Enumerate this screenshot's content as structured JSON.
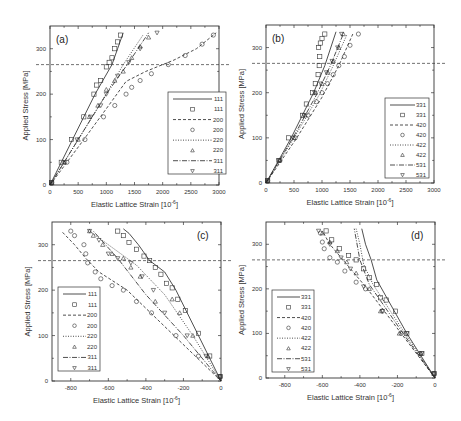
{
  "chart_data": [
    {
      "panel": "(a)",
      "type": "line",
      "xlabel": "Elastic Lattice Strain [10^-6]",
      "ylabel": "Applied Stress [MPa]",
      "xlim": [
        0,
        3000
      ],
      "ylim": [
        0,
        350
      ],
      "xticks": [
        "0",
        "500",
        "1000",
        "1500",
        "2000",
        "2500",
        "3000"
      ],
      "yticks": [
        "0",
        "100",
        "200",
        "300"
      ],
      "hline": 265,
      "legend_position": "lower right",
      "legend": [
        "111",
        "111",
        "200",
        "200",
        "220",
        "220",
        "311",
        "311"
      ],
      "series": [
        {
          "name": "111",
          "style": "solid",
          "kind": "model",
          "x": [
            0,
            400,
            800,
            1100,
            1200,
            1300
          ],
          "y": [
            0,
            100,
            200,
            265,
            300,
            335
          ]
        },
        {
          "name": "111",
          "style": "square",
          "kind": "exp",
          "x": [
            30,
            200,
            380,
            600,
            780,
            830,
            900,
            1000,
            1050,
            1100,
            1150,
            1200,
            1250
          ],
          "y": [
            5,
            50,
            100,
            150,
            200,
            220,
            230,
            260,
            270,
            280,
            300,
            315,
            330
          ]
        },
        {
          "name": "200",
          "style": "dashed",
          "kind": "model",
          "x": [
            0,
            600,
            1100,
            1350,
            1700,
            2200,
            2600,
            2950
          ],
          "y": [
            0,
            100,
            185,
            228,
            250,
            275,
            300,
            335
          ]
        },
        {
          "name": "200",
          "style": "circle",
          "kind": "exp",
          "x": [
            30,
            300,
            620,
            950,
            1150,
            1350,
            1450,
            1600,
            1800,
            2100,
            2400,
            2700,
            2900
          ],
          "y": [
            5,
            50,
            100,
            150,
            175,
            200,
            215,
            230,
            245,
            265,
            285,
            310,
            330
          ]
        },
        {
          "name": "220",
          "style": "dotted",
          "kind": "model",
          "x": [
            0,
            500,
            950,
            1300,
            1650
          ],
          "y": [
            0,
            100,
            190,
            265,
            330
          ]
        },
        {
          "name": "220",
          "style": "triangle-up",
          "kind": "exp",
          "x": [
            30,
            250,
            500,
            700,
            850,
            1000,
            1150,
            1300,
            1450,
            1600,
            1750
          ],
          "y": [
            5,
            50,
            100,
            150,
            175,
            210,
            230,
            250,
            280,
            305,
            325
          ]
        },
        {
          "name": "311",
          "style": "dashdot",
          "kind": "model",
          "x": [
            0,
            550,
            1000,
            1400,
            1750
          ],
          "y": [
            0,
            110,
            200,
            270,
            335
          ]
        },
        {
          "name": "311",
          "style": "triangle-down",
          "kind": "exp",
          "x": [
            30,
            260,
            480,
            720,
            900,
            1000,
            1200,
            1400,
            1600,
            1900
          ],
          "y": [
            5,
            50,
            100,
            150,
            175,
            200,
            240,
            270,
            300,
            335
          ]
        }
      ]
    },
    {
      "panel": "(b)",
      "type": "line",
      "xlabel": "Elastic Lattice Strain [10^-6]",
      "ylabel": "Applied Stress [MPa]",
      "xlim": [
        0,
        3000
      ],
      "ylim": [
        0,
        350
      ],
      "xticks": [
        "0",
        "500",
        "1000",
        "1500",
        "2000",
        "2500",
        "3000"
      ],
      "yticks": [
        "0",
        "100",
        "200",
        "300"
      ],
      "hline": 265,
      "legend_position": "lower right",
      "legend": [
        "331",
        "331",
        "420",
        "420",
        "422",
        "422",
        "531",
        "531"
      ],
      "series": [
        {
          "name": "331",
          "style": "solid",
          "kind": "model",
          "x": [
            0,
            450,
            850,
            1050,
            1250
          ],
          "y": [
            0,
            100,
            200,
            260,
            335
          ]
        },
        {
          "name": "331",
          "style": "square",
          "kind": "exp",
          "x": [
            30,
            230,
            400,
            650,
            720,
            830,
            880,
            930,
            950,
            960,
            940,
            970,
            1000,
            1050
          ],
          "y": [
            5,
            50,
            100,
            150,
            175,
            200,
            220,
            240,
            260,
            280,
            300,
            310,
            320,
            330
          ]
        },
        {
          "name": "420",
          "style": "dashed",
          "kind": "model",
          "x": [
            0,
            550,
            1000,
            1300,
            1550
          ],
          "y": [
            0,
            100,
            190,
            260,
            330
          ]
        },
        {
          "name": "420",
          "style": "circle",
          "kind": "exp",
          "x": [
            30,
            250,
            520,
            750,
            900,
            1000,
            1100,
            1200,
            1300,
            1400,
            1500,
            1650
          ],
          "y": [
            5,
            50,
            100,
            150,
            180,
            200,
            220,
            240,
            260,
            280,
            305,
            330
          ]
        },
        {
          "name": "422",
          "style": "dotted",
          "kind": "model",
          "x": [
            0,
            500,
            950,
            1200,
            1450
          ],
          "y": [
            0,
            100,
            195,
            260,
            330
          ]
        },
        {
          "name": "422",
          "style": "triangle-up",
          "kind": "exp",
          "x": [
            30,
            240,
            500,
            700,
            880,
            1000,
            1100,
            1200,
            1300,
            1380
          ],
          "y": [
            5,
            50,
            100,
            150,
            200,
            220,
            245,
            270,
            300,
            330
          ]
        },
        {
          "name": "531",
          "style": "dashdot",
          "kind": "model",
          "x": [
            0,
            480,
            900,
            1150,
            1380
          ],
          "y": [
            0,
            100,
            195,
            260,
            330
          ]
        },
        {
          "name": "531",
          "style": "triangle-down",
          "kind": "exp",
          "x": [
            30,
            230,
            480,
            680,
            870,
            980,
            1080,
            1180,
            1280,
            1350
          ],
          "y": [
            5,
            50,
            100,
            150,
            200,
            220,
            245,
            270,
            300,
            330
          ]
        }
      ]
    },
    {
      "panel": "(c)",
      "type": "line",
      "xlabel": "Elastic Lattice Strain [10^-6]",
      "ylabel": "Applied Stress [MPa]",
      "xlim": [
        -900,
        0
      ],
      "ylim": [
        0,
        350
      ],
      "xticks": [
        "-800",
        "-600",
        "-400",
        "-200",
        "0"
      ],
      "yticks": [
        "0",
        "100",
        "200",
        "300"
      ],
      "hline": 265,
      "legend_position": "lower left",
      "legend": [
        "111",
        "111",
        "200",
        "200",
        "220",
        "220",
        "311",
        "311"
      ],
      "series": [
        {
          "name": "111",
          "style": "solid",
          "kind": "model",
          "x": [
            0,
            -120,
            -240,
            -300,
            -380,
            -440,
            -490,
            -520
          ],
          "y": [
            0,
            100,
            200,
            240,
            265,
            300,
            325,
            335
          ]
        },
        {
          "name": "111",
          "style": "square",
          "kind": "exp",
          "x": [
            -5,
            -60,
            -120,
            -190,
            -230,
            -260,
            -290,
            -320,
            -350,
            -380,
            -410,
            -450,
            -490,
            -520,
            -550
          ],
          "y": [
            10,
            55,
            105,
            155,
            180,
            205,
            215,
            235,
            250,
            265,
            275,
            290,
            305,
            320,
            330
          ]
        },
        {
          "name": "200",
          "style": "dashed",
          "kind": "model",
          "x": [
            0,
            -250,
            -500,
            -650,
            -720,
            -780,
            -850
          ],
          "y": [
            0,
            100,
            200,
            240,
            270,
            300,
            330
          ]
        },
        {
          "name": "200",
          "style": "circle",
          "kind": "exp",
          "x": [
            -5,
            -120,
            -240,
            -370,
            -450,
            -520,
            -580,
            -640,
            -670,
            -710,
            -720,
            -730,
            -780,
            -800
          ],
          "y": [
            10,
            55,
            100,
            150,
            175,
            200,
            210,
            225,
            240,
            260,
            280,
            300,
            320,
            330
          ]
        },
        {
          "name": "220",
          "style": "dotted",
          "kind": "model",
          "x": [
            0,
            -150,
            -300,
            -450,
            -600,
            -700
          ],
          "y": [
            0,
            100,
            190,
            255,
            300,
            330
          ]
        },
        {
          "name": "220",
          "style": "triangle-up",
          "kind": "exp",
          "x": [
            -5,
            -70,
            -150,
            -220,
            -260,
            -350,
            -430,
            -480,
            -520,
            -580,
            -630,
            -680,
            -700
          ],
          "y": [
            10,
            55,
            100,
            150,
            180,
            175,
            230,
            250,
            270,
            280,
            300,
            320,
            330
          ]
        },
        {
          "name": "311",
          "style": "dashdot",
          "kind": "model",
          "x": [
            0,
            -200,
            -400,
            -550,
            -680
          ],
          "y": [
            0,
            100,
            190,
            270,
            330
          ]
        },
        {
          "name": "311",
          "style": "triangle-down",
          "kind": "exp",
          "x": [
            -5,
            -80,
            -180,
            -300,
            -360,
            -420,
            -480,
            -550,
            -600,
            -650,
            -700
          ],
          "y": [
            10,
            55,
            100,
            150,
            200,
            230,
            260,
            270,
            280,
            310,
            330
          ]
        }
      ]
    },
    {
      "panel": "(d)",
      "type": "line",
      "xlabel": "Elastic Lattice Strain [10^-6]",
      "ylabel": "Applied Stress [MPa]",
      "xlim": [
        -900,
        0
      ],
      "ylim": [
        0,
        350
      ],
      "xticks": [
        "-800",
        "-600",
        "-400",
        "-200",
        "0"
      ],
      "yticks": [
        "0",
        "100",
        "200",
        "300"
      ],
      "hline": 265,
      "legend_position": "lower left",
      "legend": [
        "331",
        "331",
        "420",
        "420",
        "422",
        "422",
        "531",
        "531"
      ],
      "series": [
        {
          "name": "331",
          "style": "solid",
          "kind": "model",
          "x": [
            0,
            -150,
            -310,
            -340,
            -370,
            -390
          ],
          "y": [
            0,
            100,
            220,
            265,
            300,
            335
          ]
        },
        {
          "name": "331",
          "style": "square",
          "kind": "exp",
          "x": [
            -5,
            -70,
            -150,
            -210,
            -260,
            -290,
            -310,
            -350,
            -380,
            -420,
            -460,
            -510,
            -550,
            -580
          ],
          "y": [
            10,
            55,
            100,
            150,
            175,
            180,
            210,
            225,
            245,
            265,
            275,
            290,
            310,
            330
          ]
        },
        {
          "name": "420",
          "style": "dashed",
          "kind": "model",
          "x": [
            0,
            -180,
            -360,
            -460,
            -560,
            -600
          ],
          "y": [
            0,
            100,
            200,
            250,
            300,
            330
          ]
        },
        {
          "name": "420",
          "style": "circle",
          "kind": "exp",
          "x": [
            -5,
            -80,
            -180,
            -280,
            -370,
            -420,
            -480,
            -520,
            -560,
            -590,
            -600,
            -610
          ],
          "y": [
            10,
            55,
            100,
            150,
            200,
            215,
            240,
            260,
            270,
            290,
            305,
            325
          ]
        },
        {
          "name": "422",
          "style": "dotted",
          "kind": "model",
          "x": [
            0,
            -160,
            -330,
            -380,
            -400,
            -420
          ],
          "y": [
            0,
            100,
            210,
            255,
            300,
            335
          ]
        },
        {
          "name": "422",
          "style": "triangle-up",
          "kind": "exp",
          "x": [
            -5,
            -75,
            -190,
            -290,
            -350,
            -420,
            -470,
            -520,
            -560,
            -600
          ],
          "y": [
            10,
            55,
            100,
            150,
            200,
            235,
            260,
            285,
            305,
            325
          ]
        },
        {
          "name": "531",
          "style": "dashdot",
          "kind": "model",
          "x": [
            0,
            -170,
            -350,
            -400,
            -430
          ],
          "y": [
            0,
            100,
            210,
            265,
            335
          ]
        },
        {
          "name": "531",
          "style": "triangle-down",
          "kind": "exp",
          "x": [
            -5,
            -70,
            -150,
            -280,
            -380,
            -450,
            -500,
            -560,
            -620
          ],
          "y": [
            10,
            55,
            100,
            150,
            205,
            245,
            270,
            300,
            330
          ]
        }
      ]
    }
  ]
}
